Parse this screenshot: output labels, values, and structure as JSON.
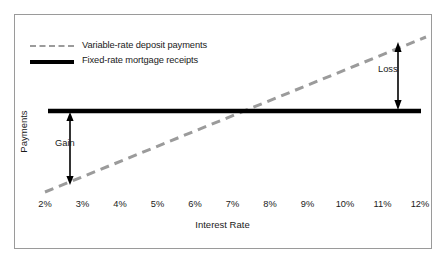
{
  "chart_data": {
    "type": "line",
    "title": "",
    "xlabel": "Interest Rate",
    "ylabel": "Payments",
    "xticklabels": [
      "2%",
      "3%",
      "4%",
      "5%",
      "6%",
      "7%",
      "8%",
      "9%",
      "10%",
      "11%",
      "12%"
    ],
    "xlim": [
      2,
      12
    ],
    "ylim": [
      0,
      100
    ],
    "grid": false,
    "legend_position": "top-left",
    "series": [
      {
        "name": "Variable-rate deposit payments",
        "style": "dashed",
        "color": "#9b9b9b",
        "x": [
          2,
          12
        ],
        "values": [
          18,
          90
        ]
      },
      {
        "name": "Fixed-rate mortgage receipts",
        "style": "solid",
        "color": "#000000",
        "x": [
          2,
          12
        ],
        "values": [
          55,
          55
        ]
      }
    ],
    "crossover_x": 7.6,
    "annotations": [
      {
        "label": "Gain",
        "x": 2.6,
        "y_from": 22,
        "y_to": 55,
        "arrow": "double-headed-vertical"
      },
      {
        "label": "Loss",
        "x": 11.4,
        "y_from": 55,
        "y_to": 86,
        "arrow": "double-headed-vertical"
      }
    ]
  },
  "legend": {
    "items": [
      {
        "label": "Variable-rate deposit payments",
        "swatch": "dashed-gray-line"
      },
      {
        "label": "Fixed-rate mortgage receipts",
        "swatch": "solid-black-line"
      }
    ]
  },
  "axes": {
    "x_title": "Interest Rate",
    "y_title": "Payments",
    "x_ticks": [
      "2%",
      "3%",
      "4%",
      "5%",
      "6%",
      "7%",
      "8%",
      "9%",
      "10%",
      "11%",
      "12%"
    ]
  },
  "annotations": {
    "gain": "Gain",
    "loss": "Loss"
  },
  "colors": {
    "variable_rate_line": "#9b9b9b",
    "fixed_rate_line": "#000000",
    "frame_border": "#9a9a9a",
    "text": "#1a1a1a",
    "background": "#ffffff"
  }
}
